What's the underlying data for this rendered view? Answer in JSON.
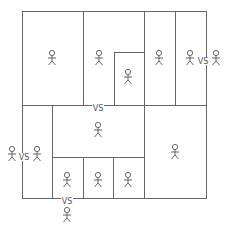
{
  "diagram": {
    "type": "bracket-tournament-map",
    "line_color": "#666666",
    "figure_color": "#555555",
    "vs_text": "VS",
    "cells": [
      {
        "id": "top-left",
        "x": 22,
        "y": 11,
        "w": 61,
        "h": 94
      },
      {
        "id": "top-middle",
        "x": 83,
        "y": 11,
        "w": 61,
        "h": 94
      },
      {
        "id": "top-middle-inner",
        "x": 114,
        "y": 52,
        "w": 30,
        "h": 53
      },
      {
        "id": "top-right-a",
        "x": 144,
        "y": 11,
        "w": 31,
        "h": 94
      },
      {
        "id": "top-right-b",
        "x": 175,
        "y": 11,
        "w": 31,
        "h": 94
      },
      {
        "id": "bottom-left-column",
        "x": 22,
        "y": 105,
        "w": 30,
        "h": 93
      },
      {
        "id": "bottom-center-top",
        "x": 52,
        "y": 105,
        "w": 92,
        "h": 52
      },
      {
        "id": "bottom-center-cell-1",
        "x": 52,
        "y": 157,
        "w": 31,
        "h": 41
      },
      {
        "id": "bottom-center-cell-2",
        "x": 83,
        "y": 157,
        "w": 30,
        "h": 41
      },
      {
        "id": "bottom-center-cell-3",
        "x": 113,
        "y": 157,
        "w": 31,
        "h": 41
      },
      {
        "id": "bottom-right",
        "x": 144,
        "y": 105,
        "w": 62,
        "h": 93
      }
    ],
    "figures": [
      {
        "id": "figure-top-left",
        "x": 52,
        "y": 58
      },
      {
        "id": "figure-top-middle",
        "x": 99,
        "y": 58
      },
      {
        "id": "figure-inner",
        "x": 128,
        "y": 77
      },
      {
        "id": "figure-top-right-a",
        "x": 159,
        "y": 58
      },
      {
        "id": "figure-top-right-b",
        "x": 190,
        "y": 58
      },
      {
        "id": "figure-outside-right",
        "x": 216,
        "y": 58
      },
      {
        "id": "figure-outside-left",
        "x": 12,
        "y": 154
      },
      {
        "id": "figure-bottom-left-column",
        "x": 37,
        "y": 154
      },
      {
        "id": "figure-bottom-center-top",
        "x": 98,
        "y": 130
      },
      {
        "id": "figure-bottom-cell-1",
        "x": 67,
        "y": 180
      },
      {
        "id": "figure-bottom-cell-2",
        "x": 98,
        "y": 180
      },
      {
        "id": "figure-bottom-cell-3",
        "x": 128,
        "y": 180
      },
      {
        "id": "figure-bottom-right",
        "x": 175,
        "y": 152
      },
      {
        "id": "figure-outside-bottom",
        "x": 67,
        "y": 215
      }
    ],
    "vs_labels": [
      {
        "id": "vs-right",
        "x": 203,
        "y": 61
      },
      {
        "id": "vs-middle",
        "x": 98,
        "y": 108
      },
      {
        "id": "vs-left",
        "x": 24,
        "y": 157
      },
      {
        "id": "vs-bottom",
        "x": 67,
        "y": 201
      }
    ]
  }
}
